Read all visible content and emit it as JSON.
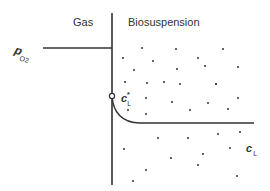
{
  "diagram": {
    "type": "interface-concentration-profile",
    "regions": {
      "gas_label": "Gas",
      "liquid_label": "Biosuspension"
    },
    "symbols": {
      "gas_partial_pressure": {
        "main": "p",
        "sub": "O2"
      },
      "interface_concentration": {
        "main": "c",
        "sub": "L",
        "sup": "*"
      },
      "bulk_concentration": {
        "main": "c",
        "sub": "L"
      }
    },
    "geometry": {
      "interface_x": 112,
      "interface_y_top": 13,
      "interface_y_bottom": 185,
      "gas_level_y": 48,
      "gas_line_x_start": 43,
      "interface_point_y": 96,
      "bulk_level_y": 123,
      "bulk_line_x_end": 254
    },
    "colors": {
      "line": "#333333",
      "dot": "#333333",
      "background": "#ffffff"
    },
    "cells": [
      [
        142,
        48
      ],
      [
        176,
        49
      ],
      [
        223,
        49
      ],
      [
        123,
        58
      ],
      [
        153,
        61
      ],
      [
        198,
        58
      ],
      [
        238,
        67
      ],
      [
        134,
        70
      ],
      [
        177,
        69
      ],
      [
        205,
        66
      ],
      [
        216,
        84
      ],
      [
        125,
        82
      ],
      [
        147,
        83
      ],
      [
        164,
        82
      ],
      [
        180,
        84
      ],
      [
        216,
        84
      ],
      [
        146,
        98
      ],
      [
        172,
        102
      ],
      [
        208,
        103
      ],
      [
        238,
        98
      ],
      [
        128,
        110
      ],
      [
        146,
        114
      ],
      [
        190,
        110
      ],
      [
        228,
        109
      ],
      [
        158,
        138
      ],
      [
        188,
        138
      ],
      [
        218,
        134
      ],
      [
        240,
        132
      ],
      [
        124,
        149
      ],
      [
        171,
        158
      ],
      [
        203,
        154
      ],
      [
        230,
        148
      ],
      [
        146,
        170
      ],
      [
        198,
        165
      ],
      [
        237,
        176
      ],
      [
        133,
        181
      ]
    ]
  }
}
